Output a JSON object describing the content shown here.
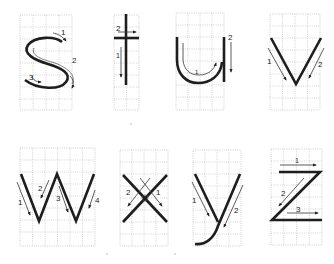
{
  "colors": {
    "ink": "#1e1e1e",
    "grid": "#b8b8b8",
    "background": "#ffffff"
  },
  "letters": [
    {
      "char": "s",
      "strokes": [
        "1",
        "2",
        "3"
      ]
    },
    {
      "char": "t",
      "strokes": [
        "1",
        "2"
      ]
    },
    {
      "char": "u",
      "strokes": [
        "1",
        "2"
      ]
    },
    {
      "char": "v",
      "strokes": [
        "1",
        "2"
      ]
    },
    {
      "char": "w",
      "strokes": [
        "1",
        "2",
        "3",
        "4"
      ]
    },
    {
      "char": "x",
      "strokes": [
        "1",
        "2"
      ]
    },
    {
      "char": "y",
      "strokes": [
        "1",
        "2"
      ]
    },
    {
      "char": "z",
      "strokes": [
        "1",
        "2",
        "3"
      ]
    }
  ],
  "labels": {
    "s": {
      "n1": "1",
      "n2": "2",
      "n3": "3"
    },
    "t": {
      "n1": "1",
      "n2": "2"
    },
    "u": {
      "n1": "1",
      "n2": "2"
    },
    "v": {
      "n1": "1",
      "n2": "2"
    },
    "w": {
      "n1": "1",
      "n2": "2",
      "n3": "3",
      "n4": "4"
    },
    "x": {
      "n1": "1",
      "n2": "2"
    },
    "y": {
      "n1": "1",
      "n2": "2"
    },
    "z": {
      "n1": "1",
      "n2": "2",
      "n3": "3"
    }
  }
}
